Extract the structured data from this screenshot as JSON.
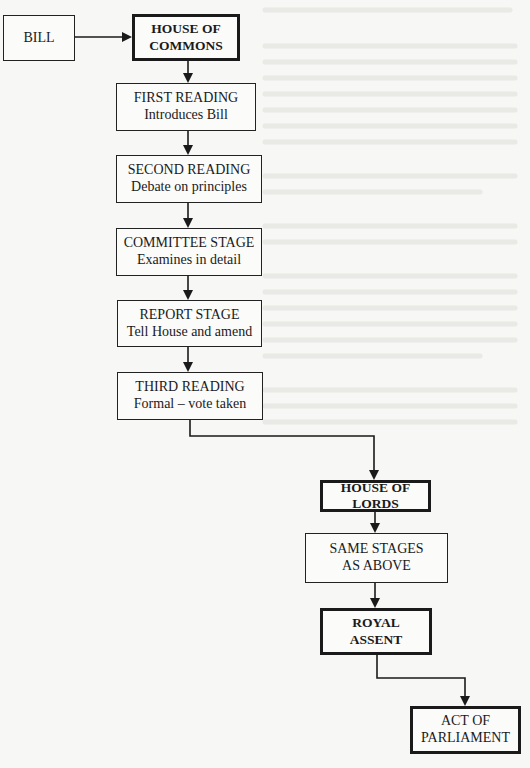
{
  "diagram": {
    "nodes": [
      {
        "id": "bill",
        "title": "BILL",
        "subtitle": ""
      },
      {
        "id": "commons",
        "title": "HOUSE OF",
        "title2": "COMMONS",
        "subtitle": ""
      },
      {
        "id": "first",
        "title": "FIRST READING",
        "subtitle": "Introduces Bill"
      },
      {
        "id": "second",
        "title": "SECOND READING",
        "subtitle": "Debate on principles"
      },
      {
        "id": "committee",
        "title": "COMMITTEE STAGE",
        "subtitle": "Examines in detail"
      },
      {
        "id": "report",
        "title": "REPORT STAGE",
        "subtitle": "Tell House and amend"
      },
      {
        "id": "third",
        "title": "THIRD READING",
        "subtitle": "Formal – vote taken"
      },
      {
        "id": "lords",
        "title": "HOUSE OF",
        "title2": "LORDS",
        "subtitle": ""
      },
      {
        "id": "same",
        "title": "SAME STAGES",
        "title2": "AS ABOVE",
        "subtitle": ""
      },
      {
        "id": "assent",
        "title": "ROYAL",
        "title2": "ASSENT",
        "subtitle": ""
      },
      {
        "id": "act",
        "title": "ACT OF",
        "title2": "PARLIAMENT",
        "subtitle": ""
      }
    ],
    "edges": [
      {
        "from": "bill",
        "to": "commons"
      },
      {
        "from": "commons",
        "to": "first"
      },
      {
        "from": "first",
        "to": "second"
      },
      {
        "from": "second",
        "to": "committee"
      },
      {
        "from": "committee",
        "to": "report"
      },
      {
        "from": "report",
        "to": "third"
      },
      {
        "from": "third",
        "to": "lords"
      },
      {
        "from": "lords",
        "to": "same"
      },
      {
        "from": "same",
        "to": "assent"
      },
      {
        "from": "assent",
        "to": "act"
      }
    ],
    "colors": {
      "line": "#1a1a1a",
      "background": "#f7f7f5"
    }
  }
}
